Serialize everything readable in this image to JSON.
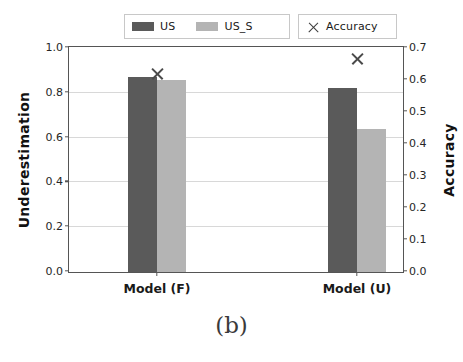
{
  "caption": "(b)",
  "legend": {
    "entries": [
      {
        "label": "US",
        "type": "bar",
        "color": "#5a5a5a"
      },
      {
        "label": "US_S",
        "type": "bar",
        "color": "#b4b4b4"
      },
      {
        "label": "Accuracy",
        "type": "marker",
        "color": "#3c3c3c"
      }
    ]
  },
  "chart_data": {
    "type": "bar",
    "title": "",
    "subtitle": "",
    "xlabel": "",
    "ylabel": "Underestimation",
    "y2label": "Accuracy",
    "categories": [
      "Model (F)",
      "Model (U)"
    ],
    "ylim": [
      0.0,
      1.0
    ],
    "y2lim": [
      0.0,
      0.7
    ],
    "yticks": [
      "0.0",
      "0.2",
      "0.4",
      "0.6",
      "0.8",
      "1.0"
    ],
    "ytick_values": [
      0.0,
      0.2,
      0.4,
      0.6,
      0.8,
      1.0
    ],
    "y2ticks": [
      "0.0",
      "0.1",
      "0.2",
      "0.3",
      "0.4",
      "0.5",
      "0.6",
      "0.7"
    ],
    "y2tick_values": [
      0.0,
      0.1,
      0.2,
      0.3,
      0.4,
      0.5,
      0.6,
      0.7
    ],
    "grid": true,
    "grid_axis": "y",
    "legend_position": "upper center",
    "series": [
      {
        "name": "US",
        "axis": "left",
        "kind": "bar",
        "color": "#5a5a5a",
        "values": [
          0.87,
          0.82
        ]
      },
      {
        "name": "US_S",
        "axis": "left",
        "kind": "bar",
        "color": "#b4b4b4",
        "values": [
          0.86,
          0.64
        ]
      },
      {
        "name": "Accuracy",
        "axis": "right",
        "kind": "marker",
        "color": "#4a4a4a",
        "marker": "x",
        "values": [
          0.62,
          0.665
        ]
      }
    ]
  }
}
